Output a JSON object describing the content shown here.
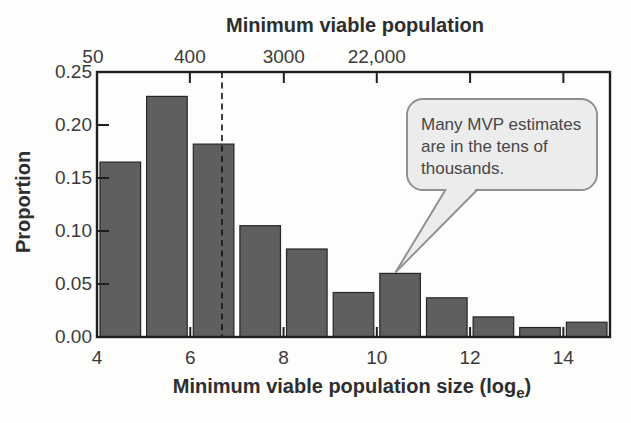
{
  "chart_data": {
    "type": "bar",
    "subtype": "histogram",
    "top_axis": {
      "title": "Minimum viable population",
      "ticks": [
        {
          "loge": 3.912,
          "label": "50",
          "draw_tick": false
        },
        {
          "loge": 5.991,
          "label": "400",
          "draw_tick": true
        },
        {
          "loge": 8.006,
          "label": "3000",
          "draw_tick": true
        },
        {
          "loge": 9.999,
          "label": "22,000",
          "draw_tick": true
        },
        {
          "loge": 12.0,
          "label": "",
          "draw_tick": true
        },
        {
          "loge": 14.0,
          "label": "",
          "draw_tick": true
        }
      ]
    },
    "xlabel_prefix": "Minimum viable population size (log",
    "xlabel_subscript": "e",
    "xlabel_suffix": ")",
    "ylabel": "Proportion",
    "xlim": [
      4,
      15
    ],
    "ylim": [
      0,
      0.25
    ],
    "x_ticks": [
      4,
      6,
      8,
      10,
      12,
      14
    ],
    "x_tick_labels": [
      "4",
      "6",
      "8",
      "10",
      "12",
      "14"
    ],
    "y_ticks": [
      0,
      0.05,
      0.1,
      0.15,
      0.2,
      0.25
    ],
    "y_tick_labels": [
      "0.00",
      "0.05",
      "0.10",
      "0.15",
      "0.20",
      "0.25"
    ],
    "bin_width": 1,
    "bins": [
      {
        "x0": 4,
        "x1": 5,
        "proportion": 0.165
      },
      {
        "x0": 5,
        "x1": 6,
        "proportion": 0.227
      },
      {
        "x0": 6,
        "x1": 7,
        "proportion": 0.182
      },
      {
        "x0": 7,
        "x1": 8,
        "proportion": 0.105
      },
      {
        "x0": 8,
        "x1": 9,
        "proportion": 0.083
      },
      {
        "x0": 9,
        "x1": 10,
        "proportion": 0.042
      },
      {
        "x0": 10,
        "x1": 11,
        "proportion": 0.06
      },
      {
        "x0": 11,
        "x1": 12,
        "proportion": 0.037
      },
      {
        "x0": 12,
        "x1": 13,
        "proportion": 0.019
      },
      {
        "x0": 13,
        "x1": 14,
        "proportion": 0.009
      },
      {
        "x0": 14,
        "x1": 15,
        "proportion": 0.014
      }
    ],
    "dashed_line_loge": 6.68,
    "annotation": {
      "lines": [
        "Many MVP estimates",
        "are in the tens of",
        "thousands."
      ],
      "points_to": {
        "loge": 10.4,
        "proportion": 0.06
      }
    },
    "grid": false,
    "legend": null,
    "colors": {
      "bar_fill": "#5d5f61",
      "bar_edge": "#262626",
      "axis": "#1f1f1f",
      "text": "#2e2e2e",
      "dashed_line": "#111111",
      "callout_fill": "#ececec",
      "callout_border": "#8f8f8f",
      "background": "#fdfdfc"
    }
  }
}
